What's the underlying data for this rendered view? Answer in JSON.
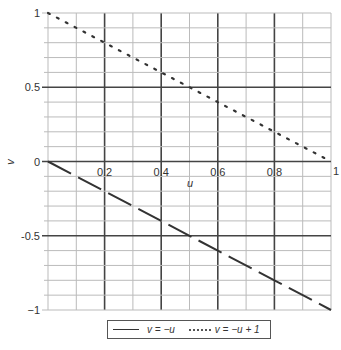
{
  "chart_data": {
    "type": "line",
    "title": "",
    "xlabel": "u",
    "ylabel": "v",
    "xlim": [
      0,
      1
    ],
    "ylim": [
      -1,
      1
    ],
    "grid": true,
    "x_ticks": [
      "0.2",
      "0.4",
      "0.6",
      "0.8",
      "1"
    ],
    "y_ticks": [
      "1",
      "0.5",
      "0",
      "-0.5",
      "−1"
    ],
    "x_tick_values": [
      0.2,
      0.4,
      0.6,
      0.8,
      1
    ],
    "y_tick_values": [
      1,
      0.5,
      0,
      -0.5,
      -1
    ],
    "legend_position": "bottom",
    "series": [
      {
        "name": "v = −u",
        "style": "dashed",
        "x": [
          0,
          0.2,
          0.4,
          0.6,
          0.8,
          1
        ],
        "y": [
          0,
          -0.2,
          -0.4,
          -0.6,
          -0.8,
          -1
        ]
      },
      {
        "name": "v = −u + 1",
        "style": "dotted",
        "x": [
          0,
          0.2,
          0.4,
          0.6,
          0.8,
          1
        ],
        "y": [
          1,
          0.8,
          0.6,
          0.4,
          0.2,
          0
        ]
      }
    ]
  },
  "labels": {
    "x_axis": "u",
    "y_axis": "v",
    "y_tick_1": "1",
    "y_tick_05": "0.5",
    "y_tick_0": "0",
    "y_tick_m05": "-0.5",
    "y_tick_m1": "−1",
    "x_tick_02": "0.2",
    "x_tick_04": "0.4",
    "x_tick_06": "0.6",
    "x_tick_08": "0.8",
    "x_tick_1": "1"
  },
  "legend": {
    "items": [
      {
        "label": "v = −u",
        "style": "solid"
      },
      {
        "label": "v = −u + 1",
        "style": "dotted"
      }
    ]
  },
  "colors": {
    "grid_minor": "#bbbbbb",
    "grid_major": "#444444",
    "line": "#333333"
  }
}
